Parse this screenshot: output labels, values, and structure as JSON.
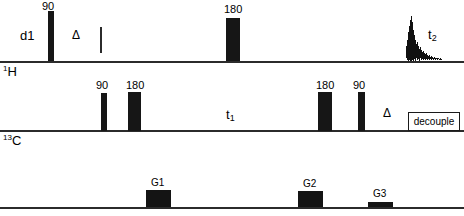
{
  "diagram": {
    "colors": {
      "ink": "#161616",
      "line": "#2b2b2b",
      "background": "#ffffff"
    }
  },
  "channels": [
    {
      "id": "proton",
      "label_sup": "1",
      "label_main": "H"
    },
    {
      "id": "carbon",
      "label_sup": "13",
      "label_main": "C"
    },
    {
      "id": "gradient",
      "label_sup": "",
      "label_main": ""
    }
  ],
  "proton": {
    "delay_label": "d1",
    "delta_label": "Δ",
    "pulses": [
      {
        "name": "pulse-90",
        "label": "90",
        "x": 48,
        "width": 6,
        "top": 11
      },
      {
        "name": "pulse-180",
        "label": "180",
        "x": 226,
        "width": 14,
        "top": 18
      }
    ],
    "acquisition_label": "t",
    "acquisition_sub": "2"
  },
  "carbon": {
    "evolution_label": "t",
    "evolution_sub": "1",
    "delta_label": "Δ",
    "decouple_label": "decouple",
    "pulses": [
      {
        "name": "pulse-90-first",
        "label": "90",
        "x": 101,
        "width": 6,
        "top": 93
      },
      {
        "name": "pulse-180-first",
        "label": "180",
        "x": 128,
        "width": 13,
        "top": 92
      },
      {
        "name": "pulse-180-second",
        "label": "180",
        "x": 318,
        "width": 14,
        "top": 92
      },
      {
        "name": "pulse-90-second",
        "label": "90",
        "x": 358,
        "width": 7,
        "top": 92
      }
    ]
  },
  "gradients": [
    {
      "name": "gradient-g1",
      "label": "G1",
      "x": 146,
      "width": 25,
      "top": 190
    },
    {
      "name": "gradient-g2",
      "label": "G2",
      "x": 298,
      "width": 25,
      "top": 191
    },
    {
      "name": "gradient-g3",
      "label": "G3",
      "x": 368,
      "width": 25,
      "top": 202
    }
  ]
}
